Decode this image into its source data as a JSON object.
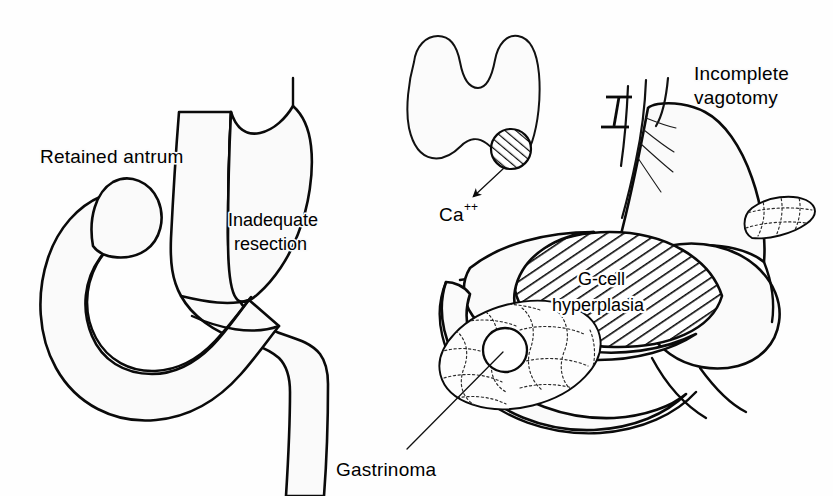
{
  "figure": {
    "background_color": "#fefefe",
    "ink_color": "#0a0a0a",
    "organ_fill_color": "#fafafa"
  },
  "labels": {
    "retained_antrum": "Retained antrum",
    "inadequate_resection_line1": "Inadequate",
    "inadequate_resection_line2": "resection",
    "calcium": "Ca",
    "calcium_superscript": "++",
    "incomplete_vagotomy_line1": "Incomplete",
    "incomplete_vagotomy_line2": "vagotomy",
    "g_cell_line1": "G-cell",
    "g_cell_line2": "hyperplasia",
    "gastrinoma": "Gastrinoma"
  },
  "panels": [
    {
      "id": "left-panel",
      "name": "post-gastrectomy-stomach-duodenum",
      "description": "Gastric remnant with duodenal loop showing retained antrum and inadequate resection",
      "annotations": [
        "Retained antrum",
        "Inadequate resection"
      ]
    },
    {
      "id": "center-panel",
      "name": "thyroid-parathyroid-adenoma",
      "description": "Thyroid gland with hatched parathyroid adenoma releasing calcium",
      "annotations": [
        "Ca++"
      ]
    },
    {
      "id": "right-panel",
      "name": "stomach-pancreas-vagus",
      "description": "Stomach with incompletely divided vagus nerve, G-cell hyperplasia in antrum and pancreatic gastrinoma",
      "annotations": [
        "Incomplete vagotomy",
        "G-cell hyperplasia",
        "Gastrinoma"
      ]
    }
  ],
  "features": [
    {
      "name": "retained-antrum-mass",
      "pattern": "diagonal-hatch",
      "direction": "bottom-left-to-top-right"
    },
    {
      "name": "parathyroid-adenoma",
      "pattern": "diagonal-hatch",
      "shape": "circle"
    },
    {
      "name": "g-cell-hyperplasia-mass",
      "pattern": "diagonal-hatch",
      "direction": "top-left-to-bottom-right"
    },
    {
      "name": "pancreas-head",
      "pattern": "stippled-lobules"
    },
    {
      "name": "pancreas-tail",
      "pattern": "stippled-lobules"
    },
    {
      "name": "gastrinoma-nodule",
      "pattern": "solid-outline-circle"
    },
    {
      "name": "vagus-nerve-cut",
      "pattern": "transection-bar"
    },
    {
      "name": "vagus-nerve-intact",
      "pattern": "branching-fibres"
    },
    {
      "name": "calcium-arrow",
      "pattern": "solid-arrowhead"
    }
  ]
}
